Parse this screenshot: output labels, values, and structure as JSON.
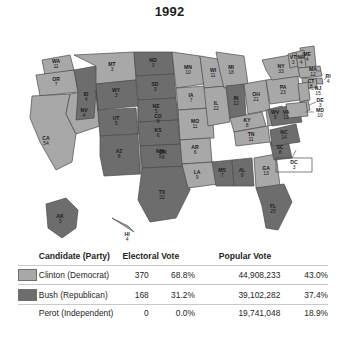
{
  "title": "1992",
  "legend": {
    "clinton_color": "#a8a8a8",
    "bush_color": "#6d6d6d",
    "border_color": "#4a4a4a"
  },
  "table": {
    "headers": {
      "candidate": "Candidate (Party)",
      "electoral": "Electoral Vote",
      "popular": "Popular Vote"
    },
    "rows": [
      {
        "name": "Clinton (Democrat)",
        "electoral_votes": "370",
        "electoral_pct": "68.8%",
        "popular_votes": "44,908,233",
        "popular_pct": "43.0%",
        "swatch": "#a8a8a8",
        "has_swatch": true
      },
      {
        "name": "Bush (Republican)",
        "electoral_votes": "168",
        "electoral_pct": "31.2%",
        "popular_votes": "39,102,282",
        "popular_pct": "37.4%",
        "swatch": "#6d6d6d",
        "has_swatch": true
      },
      {
        "name": "Perot (Independent)",
        "electoral_votes": "0",
        "electoral_pct": "0.0%",
        "popular_votes": "19,741,048",
        "popular_pct": "18.9%",
        "swatch": null,
        "has_swatch": false
      }
    ]
  },
  "chart_data": {
    "type": "map",
    "title": "1992",
    "legend_entries": [
      "Clinton (Democrat)",
      "Bush (Republican)",
      "Perot (Independent)"
    ],
    "states": [
      {
        "code": "WA",
        "votes": 11,
        "winner": "Clinton"
      },
      {
        "code": "OR",
        "votes": 7,
        "winner": "Clinton"
      },
      {
        "code": "CA",
        "votes": 54,
        "winner": "Clinton"
      },
      {
        "code": "NV",
        "votes": 4,
        "winner": "Clinton"
      },
      {
        "code": "ID",
        "votes": 4,
        "winner": "Bush"
      },
      {
        "code": "MT",
        "votes": 3,
        "winner": "Clinton"
      },
      {
        "code": "WY",
        "votes": 3,
        "winner": "Bush"
      },
      {
        "code": "UT",
        "votes": 5,
        "winner": "Bush"
      },
      {
        "code": "AZ",
        "votes": 8,
        "winner": "Bush"
      },
      {
        "code": "CO",
        "votes": 8,
        "winner": "Clinton"
      },
      {
        "code": "NM",
        "votes": 5,
        "winner": "Clinton"
      },
      {
        "code": "ND",
        "votes": 3,
        "winner": "Bush"
      },
      {
        "code": "SD",
        "votes": 3,
        "winner": "Bush"
      },
      {
        "code": "NE",
        "votes": 5,
        "winner": "Bush"
      },
      {
        "code": "KS",
        "votes": 6,
        "winner": "Bush"
      },
      {
        "code": "OK",
        "votes": 8,
        "winner": "Bush"
      },
      {
        "code": "TX",
        "votes": 32,
        "winner": "Bush"
      },
      {
        "code": "MN",
        "votes": 10,
        "winner": "Clinton"
      },
      {
        "code": "IA",
        "votes": 7,
        "winner": "Clinton"
      },
      {
        "code": "MO",
        "votes": 11,
        "winner": "Clinton"
      },
      {
        "code": "AR",
        "votes": 6,
        "winner": "Clinton"
      },
      {
        "code": "LA",
        "votes": 9,
        "winner": "Clinton"
      },
      {
        "code": "WI",
        "votes": 11,
        "winner": "Clinton"
      },
      {
        "code": "IL",
        "votes": 22,
        "winner": "Clinton"
      },
      {
        "code": "MS",
        "votes": 7,
        "winner": "Bush"
      },
      {
        "code": "AL",
        "votes": 9,
        "winner": "Bush"
      },
      {
        "code": "MI",
        "votes": 18,
        "winner": "Clinton"
      },
      {
        "code": "IN",
        "votes": 12,
        "winner": "Bush"
      },
      {
        "code": "OH",
        "votes": 21,
        "winner": "Clinton"
      },
      {
        "code": "KY",
        "votes": 8,
        "winner": "Clinton"
      },
      {
        "code": "TN",
        "votes": 11,
        "winner": "Clinton"
      },
      {
        "code": "GA",
        "votes": 13,
        "winner": "Clinton"
      },
      {
        "code": "FL",
        "votes": 25,
        "winner": "Bush"
      },
      {
        "code": "SC",
        "votes": 8,
        "winner": "Bush"
      },
      {
        "code": "NC",
        "votes": 14,
        "winner": "Bush"
      },
      {
        "code": "WV",
        "votes": 5,
        "winner": "Clinton"
      },
      {
        "code": "VA",
        "votes": 13,
        "winner": "Bush"
      },
      {
        "code": "PA",
        "votes": 23,
        "winner": "Clinton"
      },
      {
        "code": "NY",
        "votes": 33,
        "winner": "Clinton"
      },
      {
        "code": "ME",
        "votes": 4,
        "winner": "Clinton"
      },
      {
        "code": "VT",
        "votes": 3,
        "winner": "Clinton"
      },
      {
        "code": "NH",
        "votes": 4,
        "winner": "Clinton"
      },
      {
        "code": "MA",
        "votes": 12,
        "winner": "Clinton"
      },
      {
        "code": "RI",
        "votes": 4,
        "winner": "Clinton"
      },
      {
        "code": "CT",
        "votes": 8,
        "winner": "Clinton"
      },
      {
        "code": "NJ",
        "votes": 15,
        "winner": "Clinton"
      },
      {
        "code": "DE",
        "votes": 3,
        "winner": "Clinton"
      },
      {
        "code": "MD",
        "votes": 10,
        "winner": "Clinton"
      },
      {
        "code": "DC",
        "votes": 3,
        "winner": "Clinton"
      },
      {
        "code": "AK",
        "votes": 3,
        "winner": "Bush"
      },
      {
        "code": "HI",
        "votes": 4,
        "winner": "Clinton"
      }
    ]
  }
}
